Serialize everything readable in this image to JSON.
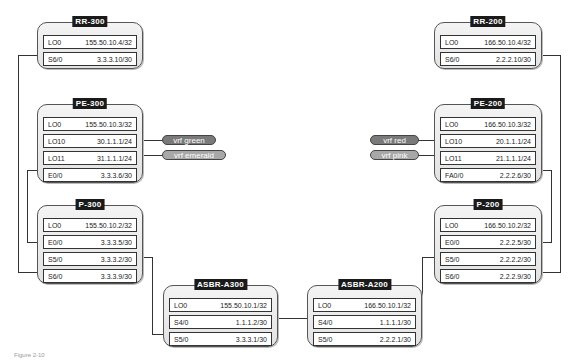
{
  "routers": {
    "rr300": {
      "title": "RR-300",
      "interfaces": [
        {
          "name": "LO0",
          "ip": "155.50.10.4/32"
        },
        {
          "name": "S6/0",
          "ip": "3.3.3.10/30"
        }
      ]
    },
    "pe300": {
      "title": "PE-300",
      "interfaces": [
        {
          "name": "LO0",
          "ip": "155.50.10.3/32"
        },
        {
          "name": "LO10",
          "ip": "30.1.1.1/24"
        },
        {
          "name": "LO11",
          "ip": "31.1.1.1/24"
        },
        {
          "name": "E0/0",
          "ip": "3.3.3.6/30"
        }
      ]
    },
    "p300": {
      "title": "P-300",
      "interfaces": [
        {
          "name": "LO0",
          "ip": "155.50.10.2/32"
        },
        {
          "name": "E0/0",
          "ip": "3.3.3.5/30"
        },
        {
          "name": "S5/0",
          "ip": "3.3.3.2/30"
        },
        {
          "name": "S6/0",
          "ip": "3.3.3.9/30"
        }
      ]
    },
    "asbra300": {
      "title": "ASBR-A300",
      "interfaces": [
        {
          "name": "LO0",
          "ip": "155.50.10.1/32"
        },
        {
          "name": "S4/0",
          "ip": "1.1.1.2/30"
        },
        {
          "name": "S5/0",
          "ip": "3.3.3.1/30"
        }
      ]
    },
    "asbra200": {
      "title": "ASBR-A200",
      "interfaces": [
        {
          "name": "LO0",
          "ip": "166.50.10.1/32"
        },
        {
          "name": "S4/0",
          "ip": "1.1.1.1/30"
        },
        {
          "name": "S5/0",
          "ip": "2.2.2.1/30"
        }
      ]
    },
    "rr200": {
      "title": "RR-200",
      "interfaces": [
        {
          "name": "LO0",
          "ip": "166.50.10.4/32"
        },
        {
          "name": "S6/0",
          "ip": "2.2.2.10/30"
        }
      ]
    },
    "pe200": {
      "title": "PE-200",
      "interfaces": [
        {
          "name": "LO0",
          "ip": "166.50.10.3/32"
        },
        {
          "name": "LO10",
          "ip": "20.1.1.1/24"
        },
        {
          "name": "LO11",
          "ip": "21.1.1.1/24"
        },
        {
          "name": "FA0/0",
          "ip": "2.2.2.6/30"
        }
      ]
    },
    "p200": {
      "title": "P-200",
      "interfaces": [
        {
          "name": "LO0",
          "ip": "166.50.10.2/32"
        },
        {
          "name": "E0/0",
          "ip": "2.2.2.5/30"
        },
        {
          "name": "S5/0",
          "ip": "2.2.2.2/30"
        },
        {
          "name": "S6/0",
          "ip": "2.2.2.9/30"
        }
      ]
    }
  },
  "vrfs": {
    "green": "vrf green",
    "emerald": "vrf emerald",
    "red": "vrf red",
    "pink": "vrf pink"
  },
  "caption": "Figure 2-10"
}
